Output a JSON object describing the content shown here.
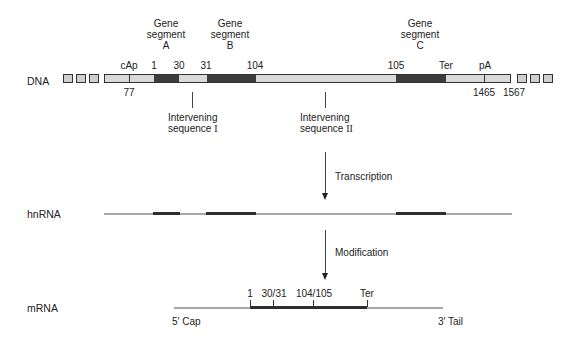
{
  "rows": {
    "dna_label": "DNA",
    "hnrna_label": "hnRNA",
    "mrna_label": "mRNA"
  },
  "dna": {
    "gene_segments": [
      {
        "line1": "Gene",
        "line2": "segment",
        "line3": "A"
      },
      {
        "line1": "Gene",
        "line2": "segment",
        "line3": "B"
      },
      {
        "line1": "Gene",
        "line2": "segment",
        "line3": "C"
      }
    ],
    "top_labels": {
      "cap": "cAp",
      "s1": "1",
      "s30": "30",
      "s31": "31",
      "s104": "104",
      "s105": "105",
      "ter": "Ter",
      "pa": "pA"
    },
    "bottom_labels": {
      "n77": "77",
      "n1465": "1465",
      "n1567": "1567"
    },
    "intervening": [
      {
        "line1": "Intervening",
        "line2": "sequence",
        "numeral": "I"
      },
      {
        "line1": "Intervening",
        "line2": "sequence",
        "numeral": "II"
      }
    ],
    "colors": {
      "exon": "#3c3c3c",
      "intron": "#d9d9d9",
      "border": "#333333"
    }
  },
  "steps": {
    "transcription": "Transcription",
    "modification": "Modification"
  },
  "mrna": {
    "labels": {
      "s1": "1",
      "s30_31": "30/31",
      "s104_105": "104/105",
      "ter": "Ter"
    },
    "cap": "5′ Cap",
    "tail": "3′ Tail"
  }
}
